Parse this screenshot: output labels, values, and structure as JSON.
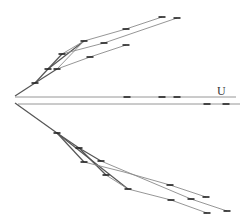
{
  "diagram": {
    "type": "mirrored-branching-tree",
    "label_U": "U",
    "colors": {
      "background": "#ffffff",
      "edge": "#8a8a8a",
      "edge_dark": "#555555",
      "tick": "#222222",
      "label": "#333333"
    },
    "upper_tree": {
      "root": [
        15,
        96
      ],
      "edges": [
        {
          "from": [
            15,
            96
          ],
          "to": [
            35,
            83
          ],
          "dark": true
        },
        {
          "from": [
            35,
            83
          ],
          "to": [
            48,
            69
          ],
          "dark": true
        },
        {
          "from": [
            35,
            83
          ],
          "to": [
            57,
            69
          ],
          "dark": true
        },
        {
          "from": [
            48,
            69
          ],
          "to": [
            62,
            54
          ],
          "dark": true
        },
        {
          "from": [
            48,
            69
          ],
          "to": [
            84,
            41
          ],
          "dark": true
        },
        {
          "from": [
            57,
            69
          ],
          "to": [
            84,
            41
          ],
          "dark": false
        },
        {
          "from": [
            62,
            54
          ],
          "to": [
            84,
            41
          ],
          "dark": false
        },
        {
          "from": [
            62,
            54
          ],
          "to": [
            104,
            43
          ],
          "dark": false
        },
        {
          "from": [
            57,
            69
          ],
          "to": [
            90,
            57
          ],
          "dark": false
        },
        {
          "from": [
            84,
            41
          ],
          "to": [
            126,
            29
          ],
          "dark": false
        },
        {
          "from": [
            126,
            29
          ],
          "to": [
            162,
            17
          ],
          "dark": false
        },
        {
          "from": [
            104,
            43
          ],
          "to": [
            177,
            18
          ],
          "dark": false
        },
        {
          "from": [
            90,
            57
          ],
          "to": [
            126,
            45
          ],
          "dark": false
        }
      ],
      "ticks": [
        [
          35,
          83
        ],
        [
          48,
          69
        ],
        [
          57,
          69
        ],
        [
          62,
          54
        ],
        [
          84,
          41
        ],
        [
          104,
          43
        ],
        [
          90,
          57
        ],
        [
          126,
          29
        ],
        [
          126,
          45
        ],
        [
          162,
          17
        ],
        [
          177,
          18
        ]
      ]
    },
    "axis_lines": {
      "upper": {
        "x1": 15,
        "y1": 97,
        "x2": 236,
        "y2": 97,
        "ticks": [
          [
            127,
            97
          ],
          [
            162,
            97
          ],
          [
            177,
            97
          ]
        ]
      },
      "lower": {
        "x1": 18,
        "y1": 104,
        "x2": 240,
        "y2": 104,
        "ticks": [
          [
            207,
            104
          ],
          [
            226,
            104
          ]
        ]
      },
      "label_position": [
        217,
        95
      ]
    },
    "lower_tree": {
      "root": [
        15,
        103
      ],
      "edges": [
        {
          "from": [
            15,
            103
          ],
          "to": [
            57,
            133
          ],
          "dark": true
        },
        {
          "from": [
            57,
            133
          ],
          "to": [
            79,
            148
          ],
          "dark": true
        },
        {
          "from": [
            57,
            133
          ],
          "to": [
            84,
            162
          ],
          "dark": true
        },
        {
          "from": [
            57,
            133
          ],
          "to": [
            128,
            189
          ],
          "dark": true
        },
        {
          "from": [
            79,
            148
          ],
          "to": [
            101,
            161
          ],
          "dark": true
        },
        {
          "from": [
            79,
            148
          ],
          "to": [
            106,
            175
          ],
          "dark": true
        },
        {
          "from": [
            84,
            162
          ],
          "to": [
            124,
            172
          ],
          "dark": false
        },
        {
          "from": [
            124,
            172
          ],
          "to": [
            170,
            185
          ],
          "dark": false
        },
        {
          "from": [
            170,
            185
          ],
          "to": [
            206,
            197
          ],
          "dark": false
        },
        {
          "from": [
            101,
            161
          ],
          "to": [
            191,
            199
          ],
          "dark": false
        },
        {
          "from": [
            191,
            199
          ],
          "to": [
            227,
            211
          ],
          "dark": false
        },
        {
          "from": [
            106,
            175
          ],
          "to": [
            128,
            189
          ],
          "dark": false
        },
        {
          "from": [
            128,
            189
          ],
          "to": [
            171,
            200
          ],
          "dark": false
        },
        {
          "from": [
            171,
            200
          ],
          "to": [
            207,
            213
          ],
          "dark": false
        }
      ],
      "ticks": [
        [
          57,
          133
        ],
        [
          79,
          148
        ],
        [
          84,
          162
        ],
        [
          101,
          161
        ],
        [
          106,
          175
        ],
        [
          128,
          189
        ],
        [
          170,
          185
        ],
        [
          206,
          197
        ],
        [
          191,
          199
        ],
        [
          227,
          211
        ],
        [
          171,
          200
        ],
        [
          207,
          213
        ]
      ]
    }
  }
}
